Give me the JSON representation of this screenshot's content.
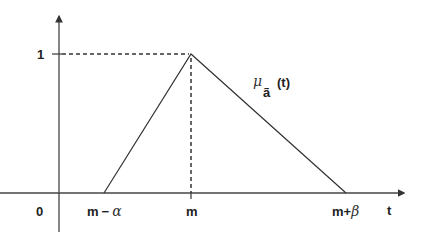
{
  "diagram": {
    "y_axis": {
      "tick_label": "1"
    },
    "x_axis": {
      "origin_label": "0",
      "axis_label": "t",
      "tick_labels": {
        "left": "m",
        "left_op": "−",
        "left_greek": "α",
        "peak": "m",
        "right": "m",
        "right_op": "+",
        "right_greek": "β"
      }
    },
    "curve_label": {
      "symbol": "μ",
      "subscript": "ã",
      "argument": "(t)"
    },
    "colors": {
      "line": "#333333",
      "background": "#ffffff"
    }
  }
}
